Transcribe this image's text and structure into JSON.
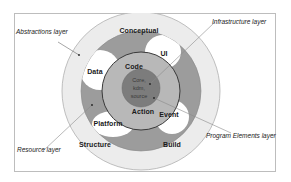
{
  "diagram": {
    "type": "concentric-layers",
    "layers": [
      {
        "id": "abstractions",
        "callout": "Abstractions layer",
        "color": "#ececec",
        "segments": [
          "Conceptual",
          "Structure",
          "Build"
        ]
      },
      {
        "id": "resource",
        "callout": "Resource layer",
        "color": "#9c9c9c",
        "segments": [
          "Data",
          "UI",
          "Platform",
          "Event"
        ]
      },
      {
        "id": "program_elements",
        "callout": "Program Elements layer",
        "color": "#b8b8b8",
        "segments": [
          "Code",
          "Action"
        ]
      },
      {
        "id": "infrastructure",
        "callout": "Infrastructure layer",
        "color": "#7a7a7a",
        "core_lines": [
          "Core,",
          "kdm,",
          "source"
        ]
      }
    ],
    "labels": {
      "conceptual": "Conceptual",
      "ui": "UI",
      "data": "Data",
      "code": "Code",
      "action": "Action",
      "event": "Event",
      "platform": "Platform",
      "structure": "Structure",
      "build": "Build"
    },
    "callouts": {
      "abstractions": "Abstractions layer",
      "infrastructure": "Infrastructure layer",
      "resource": "Resource layer",
      "program_elements": "Program Elements layer"
    },
    "core": {
      "line1": "Core,",
      "line2": "kdm,",
      "line3": "source"
    }
  }
}
